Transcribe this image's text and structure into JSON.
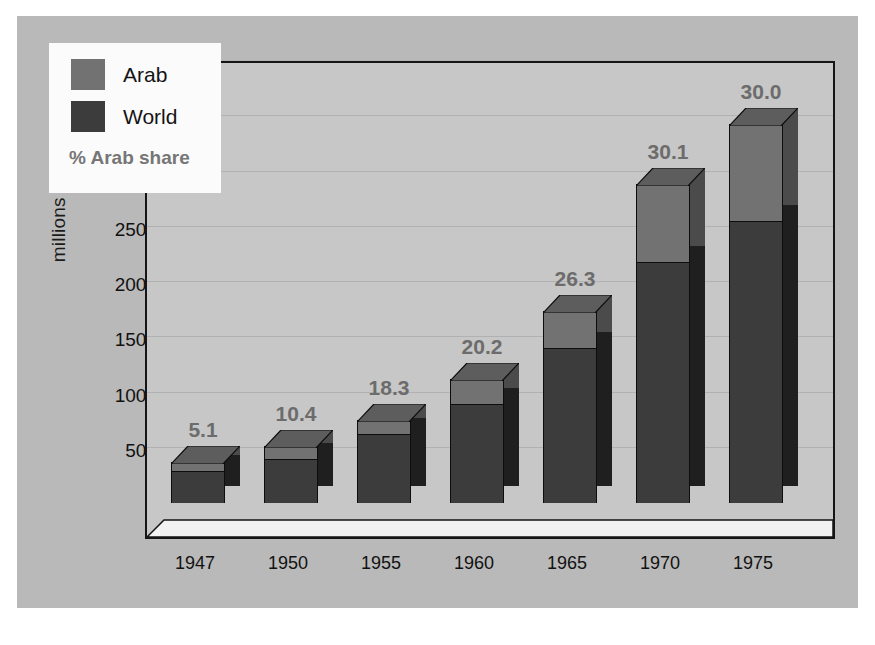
{
  "chart_data": {
    "type": "bar",
    "subtype": "stacked-3d-column",
    "title": "",
    "xlabel": "",
    "ylabel": "millions of tonnes",
    "ylim": [
      0,
      4000
    ],
    "ytick_values": [
      500,
      1000,
      1500,
      2000,
      2500,
      3000,
      3500,
      4000
    ],
    "ytick_labels": [
      "500",
      "1000",
      "1500",
      "2000",
      "2500",
      "3000",
      "3500",
      "4000"
    ],
    "grid": true,
    "legend_position": "upper-left-inside",
    "categories": [
      "1947",
      "1950",
      "1955",
      "1960",
      "1965",
      "1970",
      "1975"
    ],
    "series": [
      {
        "name": "World",
        "color": "#3c3c3c",
        "values": [
          285,
          390,
          615,
          890,
          1390,
          2170,
          2540
        ]
      },
      {
        "name": "Arab",
        "color": "#727272",
        "values": [
          65,
          110,
          120,
          215,
          330,
          700,
          870
        ]
      }
    ],
    "totals": [
      350,
      500,
      735,
      1105,
      1720,
      2870,
      3410
    ],
    "annotations": {
      "label": "% Arab share",
      "values": [
        "5.1",
        "10.4",
        "18.3",
        "20.2",
        "26.3",
        "30.1",
        "30.0"
      ]
    }
  },
  "legend": {
    "entries": [
      {
        "label": "Arab",
        "color": "#727272"
      },
      {
        "label": "World",
        "color": "#3c3c3c"
      }
    ],
    "note": "% Arab share"
  },
  "axes": {
    "y_title": "millions of tonnes",
    "y_ticks": [
      "4000",
      "3500",
      "3000",
      "2500",
      "2000",
      "1500",
      "1000",
      "500"
    ],
    "x_ticks": [
      "1947",
      "1950",
      "1955",
      "1960",
      "1965",
      "1970",
      "1975"
    ]
  },
  "colors": {
    "panel": "#b9b9b9",
    "plot": "#c7c7c7",
    "arab": "#727272",
    "world": "#3c3c3c",
    "label": "#6c6c6c",
    "frame": "#151515"
  }
}
